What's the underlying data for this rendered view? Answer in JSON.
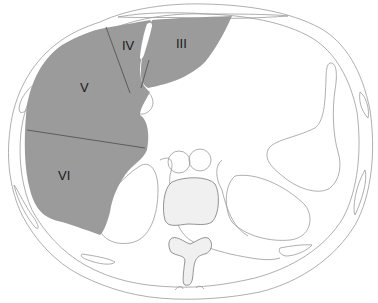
{
  "diagram": {
    "type": "axial cross-section anatomical diagram",
    "colors": {
      "liver_fill": "#9b9b9b",
      "outline": "#9a9a9a",
      "segment_divider": "#555555",
      "vertebra_fill": "#f0f0f0",
      "background": "#ffffff"
    },
    "segments": [
      {
        "id": "III",
        "label": "III"
      },
      {
        "id": "IV",
        "label": "IV"
      },
      {
        "id": "V",
        "label": "V"
      },
      {
        "id": "VI",
        "label": "VI"
      }
    ]
  }
}
